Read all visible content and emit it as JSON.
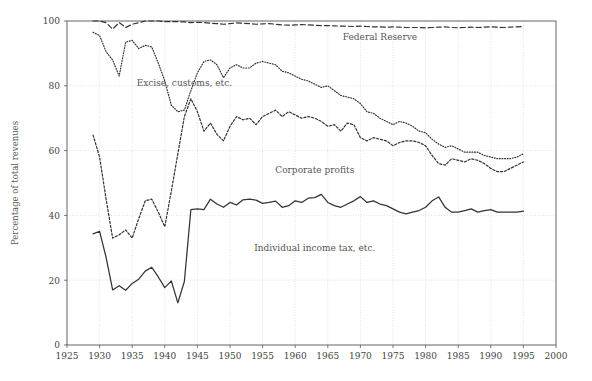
{
  "chart_data": {
    "type": "line",
    "title": "",
    "subtitle": "",
    "xlabel": "",
    "ylabel": "Percentage of total revenues",
    "xlim": [
      1925,
      2000
    ],
    "ylim": [
      0,
      100
    ],
    "xticks": [
      1925,
      1930,
      1935,
      1940,
      1945,
      1950,
      1955,
      1960,
      1965,
      1970,
      1975,
      1980,
      1985,
      1990,
      1995,
      2000
    ],
    "yticks": [
      0,
      20,
      40,
      60,
      80,
      100
    ],
    "grid": true,
    "grid_style": "dotted",
    "legend": "inline-annotations",
    "line_color": "#333333",
    "grid_color": "#cccccc",
    "axis_color": "#555555",
    "x": [
      1929,
      1930,
      1931,
      1932,
      1933,
      1934,
      1935,
      1936,
      1937,
      1938,
      1939,
      1940,
      1941,
      1942,
      1943,
      1944,
      1945,
      1946,
      1947,
      1948,
      1949,
      1950,
      1951,
      1952,
      1953,
      1954,
      1955,
      1956,
      1957,
      1958,
      1959,
      1960,
      1961,
      1962,
      1963,
      1964,
      1965,
      1966,
      1967,
      1968,
      1969,
      1970,
      1971,
      1972,
      1973,
      1974,
      1975,
      1976,
      1977,
      1978,
      1979,
      1980,
      1981,
      1982,
      1983,
      1984,
      1985,
      1986,
      1987,
      1988,
      1989,
      1990,
      1991,
      1992,
      1993,
      1994,
      1995
    ],
    "series": [
      {
        "name": "Individual income tax, etc.",
        "label": "Individual income tax, etc.",
        "style": "solid",
        "label_x": 1963,
        "label_y": 29,
        "values": [
          34.3,
          35.1,
          27.0,
          17.0,
          18.3,
          16.9,
          19.0,
          20.3,
          22.8,
          24.0,
          21.0,
          17.7,
          19.8,
          13.0,
          19.6,
          41.8,
          42.0,
          41.8,
          45.0,
          43.5,
          42.5,
          44.0,
          43.2,
          44.8,
          45.0,
          44.7,
          43.7,
          44.0,
          44.4,
          42.5,
          43.0,
          44.5,
          44.0,
          45.3,
          45.5,
          46.5,
          44.0,
          43.0,
          42.5,
          43.5,
          44.5,
          45.8,
          44.0,
          44.5,
          43.5,
          43.0,
          42.0,
          41.0,
          40.5,
          41.0,
          41.5,
          42.5,
          44.5,
          45.7,
          42.5,
          41.0,
          41.0,
          41.5,
          42.0,
          41.0,
          41.5,
          41.8,
          41.0,
          41.0,
          41.0,
          41.0,
          41.3
        ]
      },
      {
        "name": "Corporate profits (cumulative)",
        "label": "Corporate profits",
        "style": "dashed",
        "label_x": 1963,
        "label_y": 53,
        "values": [
          64.8,
          58.0,
          45.0,
          33.0,
          34.0,
          35.5,
          33.0,
          39.0,
          44.5,
          45.0,
          41.0,
          36.5,
          47.5,
          59.0,
          70.5,
          76.0,
          72.0,
          66.0,
          68.5,
          65.0,
          63.0,
          67.5,
          70.5,
          69.5,
          70.0,
          68.0,
          70.5,
          71.5,
          72.5,
          70.5,
          72.0,
          71.0,
          70.0,
          70.5,
          70.0,
          69.0,
          67.5,
          68.0,
          66.0,
          68.5,
          68.0,
          64.0,
          63.0,
          64.0,
          63.5,
          63.0,
          61.5,
          62.5,
          63.0,
          63.0,
          62.5,
          61.5,
          58.5,
          56.0,
          55.5,
          57.5,
          57.0,
          56.5,
          57.5,
          57.0,
          56.0,
          54.5,
          53.5,
          53.5,
          54.5,
          55.5,
          56.5
        ]
      },
      {
        "name": "Excise, customs, etc. (cumulative)",
        "label": "Excise, customs, etc.",
        "style": "dotted",
        "label_x": 1943,
        "label_y": 80,
        "values": [
          96.5,
          95.5,
          90.5,
          88.0,
          83.0,
          93.5,
          94.0,
          91.5,
          92.5,
          92.0,
          87.0,
          81.5,
          74.0,
          72.0,
          72.5,
          78.5,
          84.0,
          87.5,
          88.0,
          86.5,
          82.5,
          85.5,
          86.5,
          85.5,
          85.5,
          87.0,
          87.5,
          87.0,
          86.5,
          84.5,
          84.0,
          83.0,
          82.0,
          81.5,
          80.5,
          79.5,
          80.0,
          78.5,
          77.0,
          76.5,
          76.0,
          74.5,
          72.0,
          71.5,
          70.0,
          69.0,
          68.0,
          69.0,
          68.5,
          67.5,
          66.0,
          65.5,
          63.5,
          62.0,
          61.0,
          61.5,
          60.5,
          59.5,
          59.5,
          59.5,
          58.5,
          58.0,
          57.5,
          57.5,
          57.5,
          58.0,
          59.0
        ]
      },
      {
        "name": "Federal Reserve (cumulative)",
        "label": "Federal Reserve",
        "style": "longdash",
        "label_x": 1973,
        "label_y": 94,
        "values": [
          100.0,
          100.0,
          99.5,
          97.5,
          99.5,
          98.0,
          99.0,
          99.5,
          100.0,
          100.0,
          100.0,
          99.8,
          99.8,
          99.8,
          99.7,
          99.5,
          99.6,
          99.5,
          99.3,
          99.2,
          99.0,
          99.2,
          99.4,
          99.3,
          99.2,
          99.0,
          99.1,
          99.2,
          99.0,
          98.8,
          98.7,
          98.8,
          98.9,
          98.8,
          98.7,
          98.6,
          98.6,
          98.5,
          98.4,
          98.4,
          98.3,
          98.4,
          98.3,
          98.2,
          98.2,
          98.1,
          98.2,
          98.1,
          98.0,
          98.0,
          98.0,
          97.9,
          98.0,
          98.1,
          98.2,
          98.0,
          97.9,
          98.0,
          98.1,
          98.0,
          98.1,
          98.2,
          98.1,
          98.0,
          98.1,
          98.2,
          98.3
        ]
      }
    ]
  },
  "axes": {
    "ylabel": "Percentage of total revenues"
  }
}
